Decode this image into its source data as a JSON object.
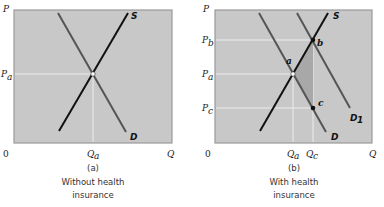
{
  "colors": {
    "plot_bg": "#c8c8c8",
    "plot_border": "#9a9a9a",
    "supply_line": "#111111",
    "demand_line": "#555555",
    "guide_line": "#f0f0f0",
    "shaded_area": "#a8a8a8"
  },
  "panel_a": {
    "y_axis_label": "P",
    "x_axis_label": "Q",
    "origin_label": "0",
    "price_label": "P",
    "price_sub": "a",
    "qty_label": "Q",
    "qty_sub": "a",
    "supply_label": "S",
    "demand_label": "D",
    "caption_letter": "(a)",
    "caption_line1": "Without health",
    "caption_line2": "insurance"
  },
  "panel_b": {
    "y_axis_label": "P",
    "x_axis_label": "Q",
    "origin_label": "0",
    "price_b_label": "P",
    "price_b_sub": "b",
    "price_a_label": "P",
    "price_a_sub": "a",
    "price_c_label": "P",
    "price_c_sub": "c",
    "qty_a_label": "Q",
    "qty_a_sub": "a",
    "qty_c_label": "Q",
    "qty_c_sub": "c",
    "supply_label": "S",
    "demand_label": "D",
    "demand1_label": "D",
    "demand1_sub": "1",
    "point_a": "a",
    "point_b": "b",
    "point_c": "c",
    "caption_letter": "(b)",
    "caption_line1": "With health",
    "caption_line2": "insurance"
  }
}
